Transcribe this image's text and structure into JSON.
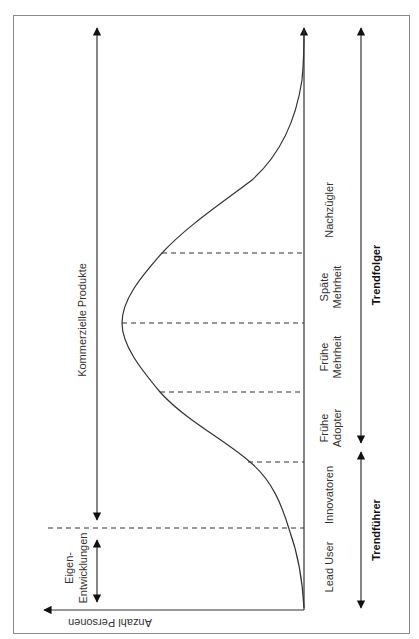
{
  "diagram": {
    "type": "diffusion-curve",
    "orientation": "rotated 90 degrees clockwise",
    "axis_y_label": "Anzahl Personen",
    "top_arrow_label": "Kommerzielle Produkte",
    "bottom_arrow_label_line1": "Eigen-",
    "bottom_arrow_label_line2": "Entwicklungen",
    "segments": [
      {
        "lines": [
          "Lead User"
        ]
      },
      {
        "lines": [
          "Innovatoren"
        ]
      },
      {
        "lines": [
          "Frühe",
          "Adopter"
        ]
      },
      {
        "lines": [
          "Frühe",
          "Mehrheit"
        ]
      },
      {
        "lines": [
          "Späte",
          "Mehrheit"
        ]
      },
      {
        "lines": [
          "Nachzügler"
        ]
      }
    ],
    "groups": [
      {
        "label": "Trendführer"
      },
      {
        "label": "Trendfolger"
      }
    ],
    "colors": {
      "line": "#333333",
      "border": "#888888",
      "text": "#333333"
    }
  }
}
